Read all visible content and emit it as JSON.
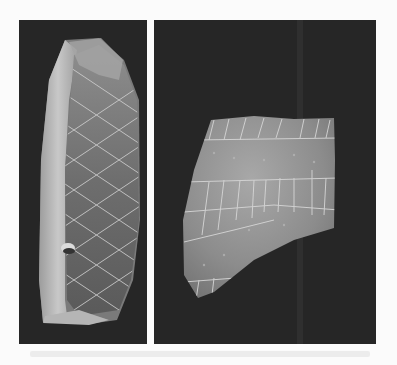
{
  "image": {
    "description": "Two photographs of engraved artifacts on dark backgrounds",
    "panels": [
      {
        "id": "left",
        "subject": "elongated stone with cross-hatched diamond engraving"
      },
      {
        "id": "right",
        "subject": "flat fragment with grid-like incised lines"
      }
    ],
    "colors": {
      "page_background": "#fbfbfb",
      "panel_background": "#262626",
      "stone_light": "#bdbdbd",
      "stone_mid": "#8a8a8a",
      "fragment": "#9a9a9a",
      "engraving": "#d8d8d8"
    }
  }
}
